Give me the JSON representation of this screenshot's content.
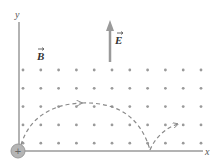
{
  "diagram": {
    "axes": {
      "x_label": "x",
      "y_label": "y"
    },
    "field_labels": {
      "magnetic": "B",
      "electric": "E"
    },
    "charge": {
      "sign": "+"
    },
    "colors": {
      "axis": "#9a9a9a",
      "dots": "#9a9a9a",
      "path": "#8a8a8a",
      "charge_fill": "#b5b5b5"
    },
    "dot_grid": {
      "columns": 11,
      "rows": 5
    }
  }
}
